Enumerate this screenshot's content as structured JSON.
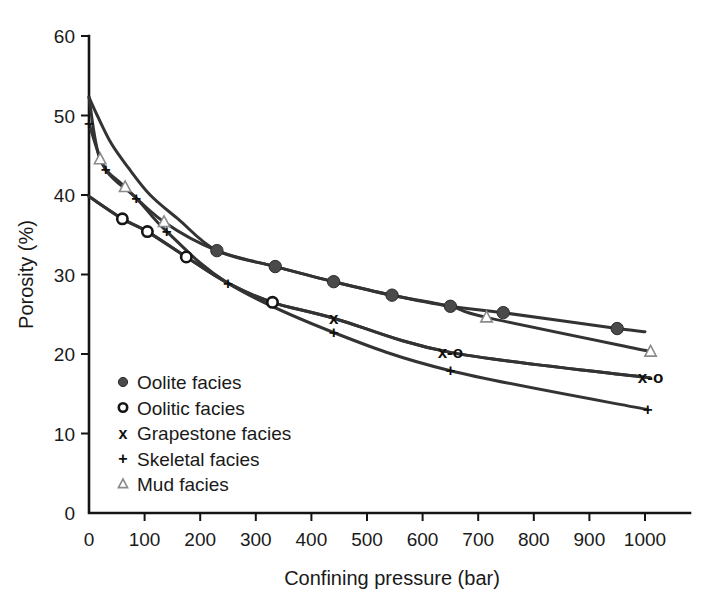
{
  "chart_data": {
    "type": "line",
    "title": "",
    "xlabel": "Confining pressure (bar)",
    "ylabel": "Porosity (%)",
    "xlim": [
      0,
      1050
    ],
    "ylim": [
      0,
      60
    ],
    "xticks": [
      0,
      100,
      200,
      300,
      400,
      500,
      600,
      700,
      800,
      900,
      1000
    ],
    "yticks": [
      0,
      10,
      20,
      30,
      40,
      50,
      60
    ],
    "xtick_labels": [
      "0",
      "100",
      "200",
      "300",
      "400",
      "500",
      "600",
      "700",
      "800",
      "900",
      "1000"
    ],
    "ytick_labels": [
      "0",
      "10",
      "20",
      "30",
      "40",
      "50",
      "60"
    ],
    "grid": false,
    "legend_position": "lower-left-inside",
    "series": [
      {
        "name": "Oolite facies",
        "marker": "filled-circle",
        "points": [
          {
            "x": 0,
            "y": 52.3
          },
          {
            "x": 15,
            "y": 50.0
          },
          {
            "x": 40,
            "y": 46.5
          },
          {
            "x": 70,
            "y": 43.5
          },
          {
            "x": 110,
            "y": 40.0
          },
          {
            "x": 160,
            "y": 37.0
          },
          {
            "x": 230,
            "y": 33.0
          },
          {
            "x": 335,
            "y": 31.0
          },
          {
            "x": 440,
            "y": 29.1
          },
          {
            "x": 545,
            "y": 27.4
          },
          {
            "x": 650,
            "y": 26.0
          },
          {
            "x": 745,
            "y": 25.2
          },
          {
            "x": 950,
            "y": 23.2
          },
          {
            "x": 1000,
            "y": 22.8
          }
        ],
        "marker_points": [
          {
            "x": 230,
            "y": 33.0
          },
          {
            "x": 335,
            "y": 31.0
          },
          {
            "x": 440,
            "y": 29.1
          },
          {
            "x": 545,
            "y": 27.4
          },
          {
            "x": 650,
            "y": 26.0
          },
          {
            "x": 745,
            "y": 25.2
          },
          {
            "x": 950,
            "y": 23.2
          }
        ]
      },
      {
        "name": "Mud facies",
        "marker": "open-triangle",
        "points": [
          {
            "x": 0,
            "y": 52.3
          },
          {
            "x": 20,
            "y": 44.5
          },
          {
            "x": 65,
            "y": 41.0
          },
          {
            "x": 135,
            "y": 36.6
          },
          {
            "x": 230,
            "y": 33.0
          },
          {
            "x": 335,
            "y": 31.0
          },
          {
            "x": 440,
            "y": 29.1
          },
          {
            "x": 545,
            "y": 27.4
          },
          {
            "x": 650,
            "y": 26.0
          },
          {
            "x": 715,
            "y": 24.6
          },
          {
            "x": 1010,
            "y": 20.3
          }
        ],
        "marker_points": [
          {
            "x": 20,
            "y": 44.5
          },
          {
            "x": 65,
            "y": 41.0
          },
          {
            "x": 135,
            "y": 36.6
          },
          {
            "x": 715,
            "y": 24.6
          },
          {
            "x": 1010,
            "y": 20.3
          }
        ]
      },
      {
        "name": "Skeletal facies",
        "marker": "plus",
        "points": [
          {
            "x": 0,
            "y": 49.0
          },
          {
            "x": 30,
            "y": 43.2
          },
          {
            "x": 85,
            "y": 39.6
          },
          {
            "x": 140,
            "y": 35.4
          },
          {
            "x": 250,
            "y": 28.9
          },
          {
            "x": 440,
            "y": 22.7
          },
          {
            "x": 650,
            "y": 17.9
          },
          {
            "x": 1005,
            "y": 13.0
          }
        ],
        "marker_points": [
          {
            "x": 0,
            "y": 49.0
          },
          {
            "x": 30,
            "y": 43.2
          },
          {
            "x": 85,
            "y": 39.6
          },
          {
            "x": 140,
            "y": 35.4
          },
          {
            "x": 250,
            "y": 28.9
          },
          {
            "x": 440,
            "y": 22.7
          },
          {
            "x": 650,
            "y": 17.9
          },
          {
            "x": 1005,
            "y": 13.0
          }
        ]
      },
      {
        "name": "Oolitic facies",
        "marker": "open-circle",
        "points": [
          {
            "x": 0,
            "y": 39.8
          },
          {
            "x": 60,
            "y": 37.0
          },
          {
            "x": 105,
            "y": 35.4
          },
          {
            "x": 175,
            "y": 32.2
          },
          {
            "x": 250,
            "y": 28.9
          },
          {
            "x": 330,
            "y": 26.5
          },
          {
            "x": 440,
            "y": 24.5
          },
          {
            "x": 650,
            "y": 20.2
          },
          {
            "x": 1010,
            "y": 17.0
          }
        ],
        "marker_points": [
          {
            "x": 60,
            "y": 37.0
          },
          {
            "x": 105,
            "y": 35.4
          },
          {
            "x": 175,
            "y": 32.2
          },
          {
            "x": 330,
            "y": 26.5
          }
        ]
      },
      {
        "name": "Grapestone facies",
        "marker": "x",
        "points": [
          {
            "x": 0,
            "y": 39.8
          },
          {
            "x": 60,
            "y": 37.0
          },
          {
            "x": 105,
            "y": 35.4
          },
          {
            "x": 175,
            "y": 32.2
          },
          {
            "x": 250,
            "y": 28.9
          },
          {
            "x": 330,
            "y": 26.5
          },
          {
            "x": 440,
            "y": 24.5
          },
          {
            "x": 650,
            "y": 20.2
          },
          {
            "x": 1010,
            "y": 17.0
          }
        ],
        "marker_points": [
          {
            "x": 440,
            "y": 24.5
          }
        ]
      }
    ],
    "combined_markers": [
      {
        "label": "x-o",
        "x": 650,
        "y": 20.2
      },
      {
        "label": "x-o",
        "x": 1010,
        "y": 17.0
      }
    ],
    "legend_entries": [
      {
        "label": "Oolite facies",
        "marker": "filled-circle"
      },
      {
        "label": "Oolitic facies",
        "marker": "open-circle"
      },
      {
        "label": "Grapestone facies",
        "marker": "x"
      },
      {
        "label": "Skeletal facies",
        "marker": "plus"
      },
      {
        "label": "Mud facies",
        "marker": "open-triangle"
      }
    ],
    "colors": {
      "line": "#333333",
      "filled_marker": "#4a4a4a",
      "triangle_marker": "#8a8a8a",
      "axis": "#141414",
      "text": "#1a1a1a",
      "background": "#ffffff"
    }
  }
}
